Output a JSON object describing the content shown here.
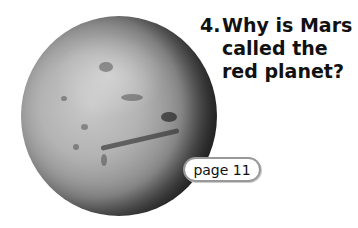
{
  "question": {
    "number": "4.",
    "lines": [
      "Why is Mars",
      "called the",
      "red planet?"
    ]
  },
  "page_ref": {
    "label": "page 11"
  },
  "image": {
    "subject": "planet-mars-grayscale"
  }
}
